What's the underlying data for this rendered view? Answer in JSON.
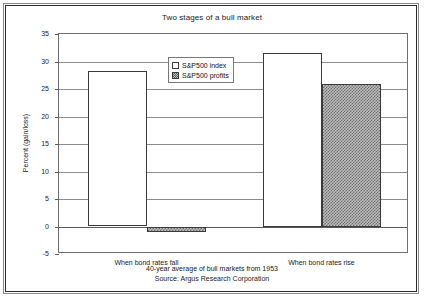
{
  "chart_data": {
    "type": "bar",
    "title": "Two stages of a bull market",
    "xlabel": "",
    "ylabel": "Percent (gain/loss)",
    "ylim": [
      -5,
      35
    ],
    "ytick_step": 5,
    "yticks": [
      35,
      30,
      25,
      20,
      15,
      10,
      5,
      0,
      -5
    ],
    "grid": true,
    "legend_position": "upper center",
    "categories": [
      "When bond rates fall",
      "When bond rates rise"
    ],
    "series": [
      {
        "name": "S&P500 index",
        "values": [
          28.3,
          31.5
        ]
      },
      {
        "name": "S&P500 profits",
        "values": [
          -1.0,
          26.0
        ]
      }
    ],
    "annotations": [
      "40-year average of bull markets from 1953",
      "Source:  Argus Research Corporation"
    ]
  },
  "footer": {
    "line1": "40-year average of bull markets from 1953",
    "line2": "Source:  Argus Research Corporation"
  },
  "yticks": {
    "t0": "35",
    "t1": "30",
    "t2": "25",
    "t3": "20",
    "t4": "15",
    "t5": "10",
    "t6": "5",
    "t7": "0",
    "t8": "-5"
  }
}
